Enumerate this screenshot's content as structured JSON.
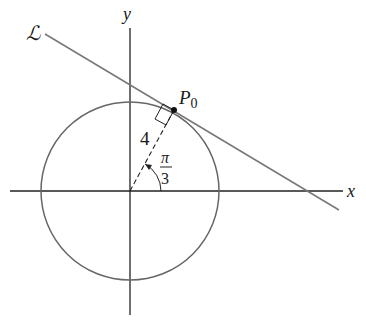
{
  "figure": {
    "axes": {
      "x_label": "x",
      "y_label": "y"
    },
    "line_label": "ℒ",
    "point_label": "P",
    "point_subscript": "0",
    "radius_label": "4",
    "angle_label": {
      "numerator": "π",
      "denominator": "3"
    },
    "colors": {
      "axes": "#222222",
      "curve": "#666666",
      "line": "#777777",
      "text": "#1a1a1a"
    }
  }
}
